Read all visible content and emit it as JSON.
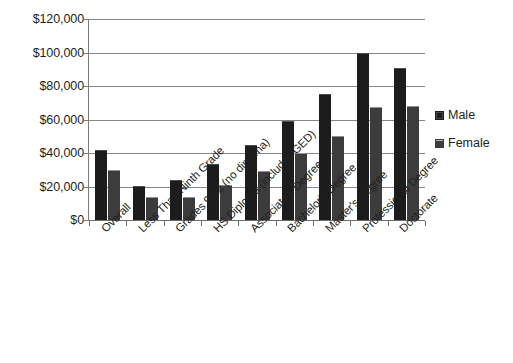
{
  "chart_data": {
    "type": "bar",
    "title": "",
    "subtitle": "",
    "xlabel": "",
    "ylabel": "",
    "ylim": [
      0,
      120000
    ],
    "y_ticks": [
      0,
      20000,
      40000,
      60000,
      80000,
      100000,
      120000
    ],
    "y_tick_labels": [
      "$0",
      "$20,000",
      "$40,000",
      "$60,000",
      "$80,000",
      "$100,000",
      "$120,000"
    ],
    "grid": true,
    "grid_axis": "y",
    "legend_position": "right",
    "orientation": "vertical",
    "categories": [
      "Overall",
      "Less Than Ninth Grade",
      "Grades 9-12 (no diploma)",
      "HS Diploma (includes GED)",
      "Associate's Degree",
      "Bachelor's Degree",
      "Master's Degree",
      "Professional Degree",
      "Doctorate"
    ],
    "series": [
      {
        "name": "Male",
        "color": "#1c1c1c",
        "values": [
          42000,
          20500,
          24000,
          33500,
          45000,
          59000,
          75000,
          100000,
          90500
        ]
      },
      {
        "name": "Female",
        "color": "#3c3c3c",
        "values": [
          30000,
          13500,
          13500,
          21000,
          29500,
          40000,
          50000,
          67500,
          68000
        ]
      }
    ]
  },
  "legend": {
    "items": [
      {
        "label": "Male",
        "swatch": "male-swatch-icon"
      },
      {
        "label": "Female",
        "swatch": "female-swatch-icon"
      }
    ]
  }
}
